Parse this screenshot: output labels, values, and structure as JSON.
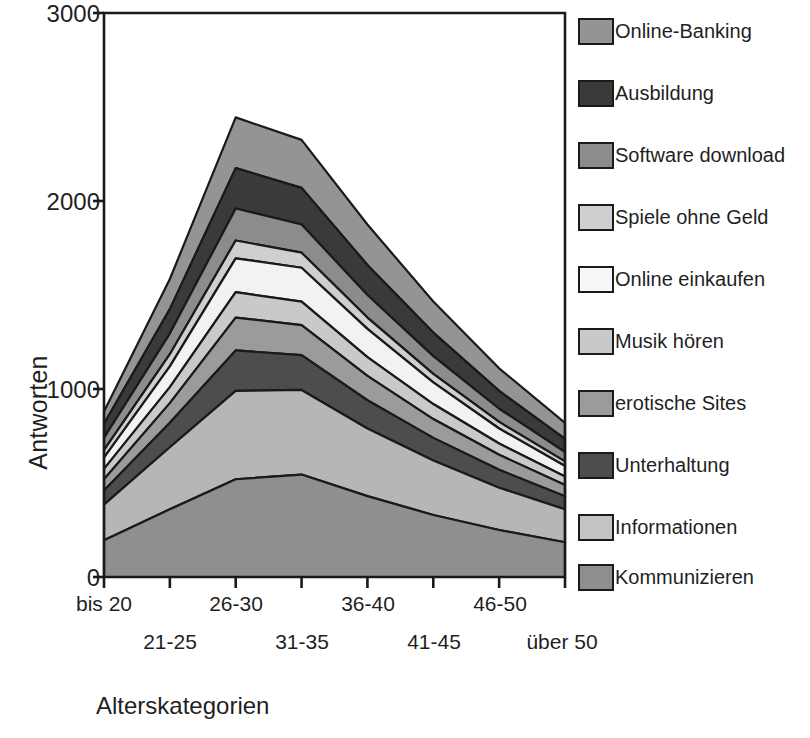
{
  "chart_data": {
    "type": "area",
    "stacked": true,
    "title": "",
    "xlabel": "Alterskategorien",
    "ylabel": "Antworten",
    "categories": [
      "bis 20",
      "21-25",
      "26-30",
      "31-35",
      "36-40",
      "41-45",
      "46-50",
      "über 50"
    ],
    "ylim": [
      0,
      3000
    ],
    "yticks": [
      0,
      1000,
      2000,
      3000
    ],
    "ytick_labels": [
      "0",
      "1000",
      "2000",
      "3000"
    ],
    "grid": false,
    "legend_position": "right",
    "axis_frame": "box",
    "series": [
      {
        "name": "Kommunizieren",
        "color": "#8f8f8f",
        "values": [
          195,
          360,
          520,
          545,
          430,
          330,
          250,
          185
        ]
      },
      {
        "name": "Informationen",
        "color": "#b6b6b6",
        "values": [
          190,
          330,
          470,
          450,
          360,
          290,
          225,
          175
        ]
      },
      {
        "name": "Unterhaltung",
        "color": "#4d4d4d",
        "values": [
          75,
          130,
          215,
          185,
          150,
          120,
          95,
          70
        ]
      },
      {
        "name": "erotische Sites",
        "color": "#9b9b9b",
        "values": [
          60,
          105,
          175,
          160,
          130,
          100,
          80,
          60
        ]
      },
      {
        "name": "Musik hören",
        "color": "#c9c9c9",
        "values": [
          55,
          85,
          135,
          125,
          100,
          80,
          60,
          45
        ]
      },
      {
        "name": "Online einkaufen",
        "color": "#f2f2f2",
        "values": [
          60,
          110,
          180,
          180,
          150,
          115,
          80,
          55
        ]
      },
      {
        "name": "Spiele ohne Geld",
        "color": "#cfcfcf",
        "values": [
          40,
          65,
          95,
          80,
          60,
          45,
          35,
          25
        ]
      },
      {
        "name": "Software download",
        "color": "#8c8c8c",
        "values": [
          65,
          110,
          170,
          150,
          120,
          95,
          70,
          50
        ]
      },
      {
        "name": "Ausbildung",
        "color": "#3a3a3a",
        "values": [
          75,
          130,
          215,
          195,
          160,
          125,
          95,
          70
        ]
      },
      {
        "name": "Online-Banking",
        "color": "#949494",
        "values": [
          65,
          160,
          270,
          255,
          215,
          165,
          120,
          85
        ]
      }
    ],
    "totals": [
      880,
      1585,
      2445,
      2325,
      1875,
      1465,
      1110,
      820
    ]
  },
  "axes": {
    "y_title": "Antworten",
    "x_title": "Alterskategorien",
    "y_ticks": [
      {
        "label": "3000"
      },
      {
        "label": "2000"
      },
      {
        "label": "1000"
      },
      {
        "label": "0"
      }
    ],
    "x_ticks": [
      {
        "label": "bis 20"
      },
      {
        "label": "21-25"
      },
      {
        "label": "26-30"
      },
      {
        "label": "31-35"
      },
      {
        "label": "36-40"
      },
      {
        "label": "41-45"
      },
      {
        "label": "46-50"
      },
      {
        "label": "über 50"
      }
    ]
  },
  "legend": {
    "items": [
      {
        "label": "Online-Banking",
        "color": "#949494"
      },
      {
        "label": "Ausbildung",
        "color": "#3a3a3a"
      },
      {
        "label": "Software download",
        "color": "#8c8c8c"
      },
      {
        "label": "Spiele ohne Geld",
        "color": "#cfcfcf"
      },
      {
        "label": "Online einkaufen",
        "color": "#f7f7f7"
      },
      {
        "label": "Musik hören",
        "color": "#c9c9c9"
      },
      {
        "label": "erotische Sites",
        "color": "#9b9b9b"
      },
      {
        "label": "Unterhaltung",
        "color": "#4d4d4d"
      },
      {
        "label": "Informationen",
        "color": "#c4c4c4"
      },
      {
        "label": "Kommunizieren",
        "color": "#8f8f8f"
      }
    ]
  },
  "style": {
    "axis_color": "#1a1a1a",
    "band_outline": "#1a1a1a",
    "background": "#ffffff"
  }
}
